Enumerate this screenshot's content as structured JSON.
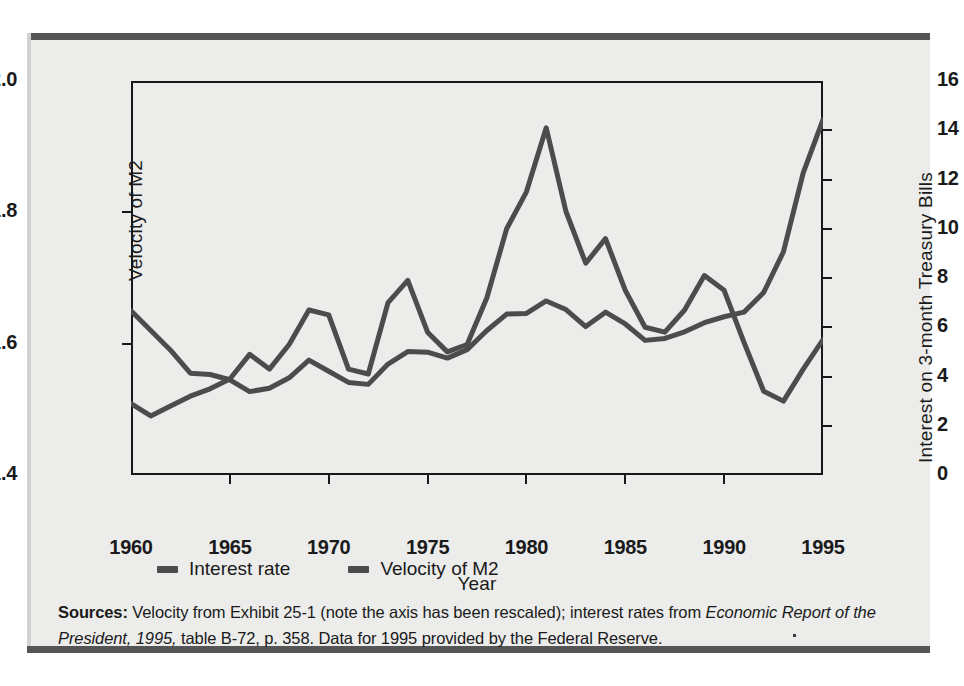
{
  "chart_data": {
    "type": "line",
    "title": "",
    "xlabel": "Year",
    "ylabel": "Velocity of M2",
    "ylabel_right": "Interest on 3-month Treasury Bills",
    "xlim": [
      1960,
      1995
    ],
    "ylim": [
      1.4,
      2.0
    ],
    "ylim_right": [
      0,
      16
    ],
    "xticks": [
      1960,
      1965,
      1970,
      1975,
      1980,
      1985,
      1990,
      1995
    ],
    "yticks_left": [
      "2.0",
      "1.8",
      "1.6",
      "1.4"
    ],
    "yticks_right": [
      "16",
      "14",
      "12",
      "10",
      "8",
      "6",
      "4",
      "2",
      "0"
    ],
    "grid": false,
    "legend_position": "below-axes",
    "x": [
      1960,
      1961,
      1962,
      1963,
      1964,
      1965,
      1966,
      1967,
      1968,
      1969,
      1970,
      1971,
      1972,
      1973,
      1974,
      1975,
      1976,
      1977,
      1978,
      1979,
      1980,
      1981,
      1982,
      1983,
      1984,
      1985,
      1986,
      1987,
      1988,
      1989,
      1990,
      1991,
      1992,
      1993,
      1994,
      1995
    ],
    "series": [
      {
        "name": "Interest rate",
        "axis": "right",
        "color": "#4b4c4e",
        "units": "percent",
        "values": [
          2.9,
          2.4,
          2.8,
          3.2,
          3.5,
          3.9,
          4.9,
          4.3,
          5.3,
          6.7,
          6.5,
          4.3,
          4.1,
          7.0,
          7.9,
          5.8,
          5.0,
          5.3,
          7.2,
          10.0,
          11.5,
          14.1,
          10.7,
          8.6,
          9.6,
          7.5,
          6.0,
          5.8,
          6.7,
          8.1,
          7.5,
          5.4,
          3.4,
          3.0,
          4.3,
          5.5
        ]
      },
      {
        "name": "Velocity of M2",
        "axis": "left",
        "color": "#4b4c4e",
        "units": "ratio",
        "values": [
          1.65,
          1.62,
          1.59,
          1.555,
          1.553,
          1.545,
          1.527,
          1.532,
          1.548,
          1.575,
          1.558,
          1.541,
          1.538,
          1.569,
          1.588,
          1.587,
          1.578,
          1.591,
          1.62,
          1.645,
          1.646,
          1.665,
          1.652,
          1.626,
          1.648,
          1.63,
          1.605,
          1.608,
          1.618,
          1.632,
          1.641,
          1.648,
          1.678,
          1.74,
          1.86,
          1.941
        ]
      }
    ]
  },
  "axis_titles": {
    "left": "Velocity of M2",
    "right": "Interest on 3-month Treasury Bills",
    "bottom": "Year"
  },
  "legend": {
    "items": [
      {
        "label": "Interest rate",
        "color": "#4b4c4e"
      },
      {
        "label": "Velocity of M2",
        "color": "#4b4c4e"
      }
    ]
  },
  "source": {
    "label": "Sources:",
    "text_1": " Velocity from Exhibit 25-1 (note the axis has been rescaled); interest rates from ",
    "italic_1": "Economic Report of the President, 1995,",
    "text_2": "  table B-72, p. 358. Data for 1995 provided by the Federal Reserve."
  },
  "colors": {
    "panel_background": "#ececeb",
    "rule": "#555557",
    "axis": "#16181a",
    "line": "#4b4c4e"
  }
}
